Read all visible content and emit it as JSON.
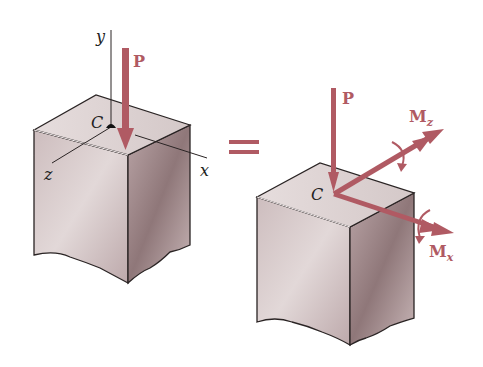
{
  "diagram": {
    "title": "",
    "colors": {
      "force": "#b05a63",
      "edge": "#2a2424",
      "face_top": "#ddd3d3",
      "face_left": "#c9b9ba",
      "face_right": "#a99597"
    },
    "left_figure": {
      "labels": {
        "y_axis": "y",
        "x_axis": "x",
        "z_axis": "z",
        "point": "C",
        "force": "P"
      }
    },
    "equals_sign": "=",
    "right_figure": {
      "labels": {
        "point": "C",
        "force": "P",
        "moment_z": "M",
        "moment_z_sub": "z",
        "moment_x": "M",
        "moment_x_sub": "x"
      }
    }
  }
}
